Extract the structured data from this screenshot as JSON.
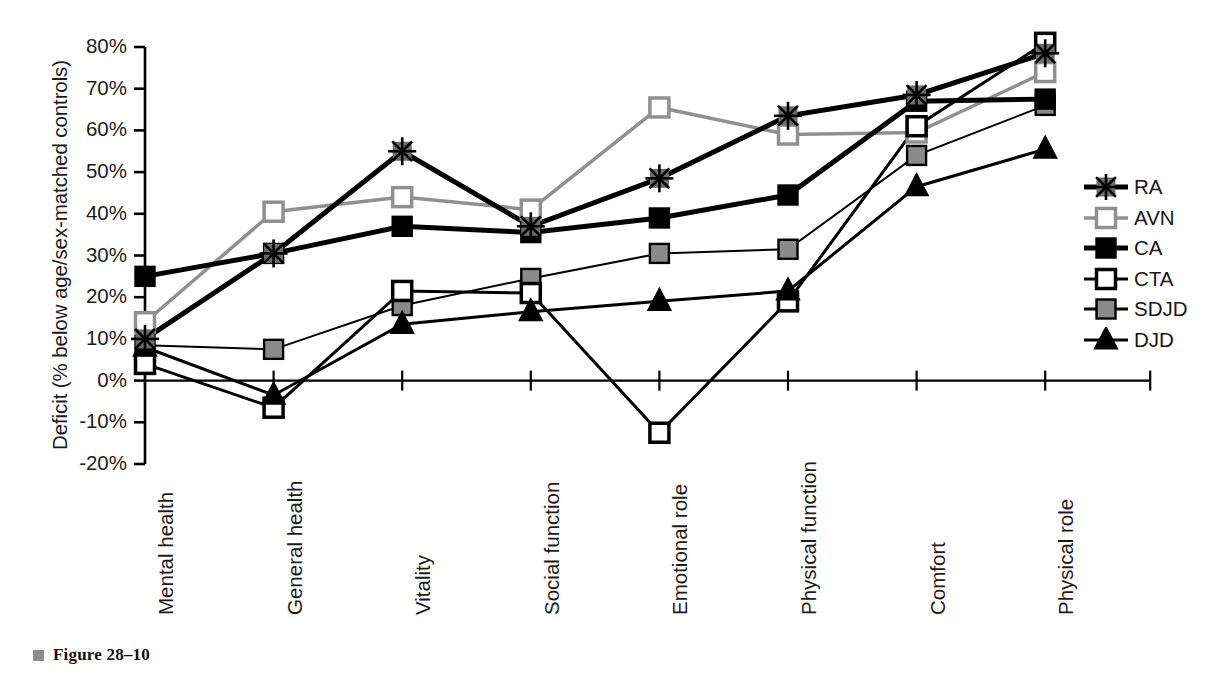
{
  "figure": {
    "caption": "Figure 28–10",
    "bullet_color": "#8e8e8e"
  },
  "chart_data": {
    "type": "line",
    "title": "",
    "subtitle": "",
    "xlabel": "",
    "ylabel": "Deficit (% below age/sex-matched controls)",
    "categories": [
      "Mental health",
      "General health",
      "Vitality",
      "Social function",
      "Emotional role",
      "Physical function",
      "Comfort",
      "Physical role"
    ],
    "ylim": [
      -20,
      80
    ],
    "ytick_labels": [
      "80%",
      "70%",
      "60%",
      "50%",
      "40%",
      "30%",
      "20%",
      "10%",
      "0%",
      "-10%",
      "-20%"
    ],
    "ytick_values": [
      80,
      70,
      60,
      50,
      40,
      30,
      20,
      10,
      0,
      -10,
      -20
    ],
    "grid": false,
    "legend_position": "right",
    "zero_line": true,
    "series": [
      {
        "name": "RA",
        "marker": "star",
        "marker_fill": "#5a5a5a",
        "line_color": "#000000",
        "line_width": 5,
        "values": [
          10,
          30.5,
          55,
          37,
          48.5,
          63.5,
          68.5,
          78.5
        ]
      },
      {
        "name": "AVN",
        "marker": "open-square",
        "marker_fill": "#ffffff",
        "marker_stroke": "#909090",
        "line_color": "#909090",
        "line_width": 3.5,
        "values": [
          14,
          40.5,
          44,
          41,
          65.5,
          59,
          59.5,
          74
        ]
      },
      {
        "name": "CA",
        "marker": "filled-square",
        "marker_fill": "#000000",
        "line_color": "#000000",
        "line_width": 5,
        "values": [
          25,
          30.5,
          37,
          35.5,
          39,
          44.5,
          67,
          67.5
        ]
      },
      {
        "name": "CTA",
        "marker": "open-square",
        "marker_fill": "#ffffff",
        "marker_stroke": "#000000",
        "line_color": "#000000",
        "line_width": 3,
        "values": [
          4,
          -6.5,
          21.5,
          21,
          -12.5,
          19,
          61,
          81
        ]
      },
      {
        "name": "SDJD",
        "marker": "gray-square",
        "marker_fill": "#8a8a8a",
        "marker_stroke": "#000000",
        "line_color": "#000000",
        "line_width": 2,
        "values": [
          8.5,
          7.5,
          18,
          24.5,
          30.5,
          31.5,
          54,
          66
        ]
      },
      {
        "name": "DJD",
        "marker": "triangle",
        "marker_fill": "#000000",
        "line_color": "#000000",
        "line_width": 3,
        "values": [
          8,
          -3.5,
          13.5,
          16.5,
          19,
          21.5,
          46.5,
          55.5
        ]
      }
    ]
  }
}
